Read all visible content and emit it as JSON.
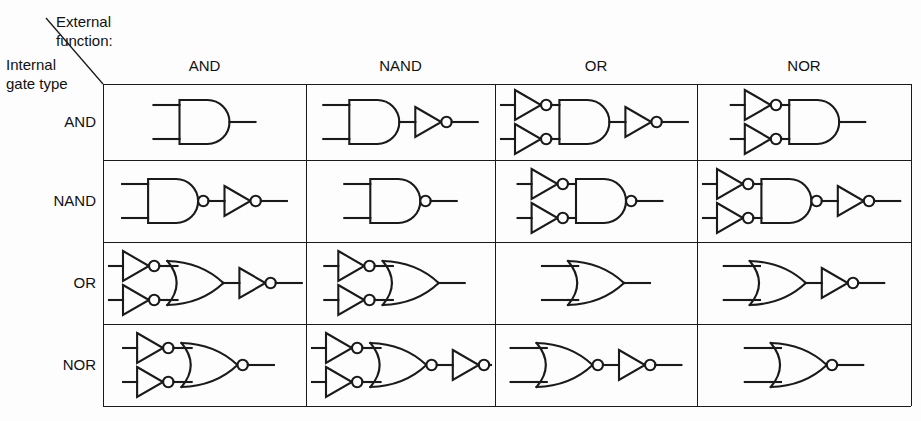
{
  "figure": {
    "type": "logic-gate-equivalence-table",
    "corner": {
      "external_label": "External\nfunction:",
      "internal_label": "Internal\ngate type"
    },
    "columns": [
      "AND",
      "NAND",
      "OR",
      "NOR"
    ],
    "rows": [
      "AND",
      "NAND",
      "OR",
      "NOR"
    ],
    "colors": {
      "ink": "#1a1a1a",
      "paper": "#fdfdfd"
    },
    "cells": [
      {
        "row": "AND",
        "col": "AND",
        "caption": "AND gate",
        "input_inverters": false,
        "gate": "AND",
        "gate_bubble": false,
        "output_inverter": false
      },
      {
        "row": "AND",
        "col": "NAND",
        "caption": "AND gate followed by inverter",
        "input_inverters": false,
        "gate": "AND",
        "gate_bubble": false,
        "output_inverter": true
      },
      {
        "row": "AND",
        "col": "OR",
        "caption": "Two input inverters, AND gate, output inverter",
        "input_inverters": true,
        "gate": "AND",
        "gate_bubble": false,
        "output_inverter": true
      },
      {
        "row": "AND",
        "col": "NOR",
        "caption": "Two input inverters feeding AND gate",
        "input_inverters": true,
        "gate": "AND",
        "gate_bubble": false,
        "output_inverter": false
      },
      {
        "row": "NAND",
        "col": "AND",
        "caption": "NAND gate followed by inverter",
        "input_inverters": false,
        "gate": "AND",
        "gate_bubble": true,
        "output_inverter": true
      },
      {
        "row": "NAND",
        "col": "NAND",
        "caption": "NAND gate",
        "input_inverters": false,
        "gate": "AND",
        "gate_bubble": true,
        "output_inverter": false
      },
      {
        "row": "NAND",
        "col": "OR",
        "caption": "Two input inverters feeding NAND gate",
        "input_inverters": true,
        "gate": "AND",
        "gate_bubble": true,
        "output_inverter": false
      },
      {
        "row": "NAND",
        "col": "NOR",
        "caption": "Two input inverters, NAND gate, output inverter",
        "input_inverters": true,
        "gate": "AND",
        "gate_bubble": true,
        "output_inverter": true
      },
      {
        "row": "OR",
        "col": "AND",
        "caption": "Two input inverters, OR gate, output inverter",
        "input_inverters": true,
        "gate": "OR",
        "gate_bubble": false,
        "output_inverter": true
      },
      {
        "row": "OR",
        "col": "NAND",
        "caption": "Two input inverters feeding OR gate",
        "input_inverters": true,
        "gate": "OR",
        "gate_bubble": false,
        "output_inverter": false
      },
      {
        "row": "OR",
        "col": "OR",
        "caption": "OR gate",
        "input_inverters": false,
        "gate": "OR",
        "gate_bubble": false,
        "output_inverter": false
      },
      {
        "row": "OR",
        "col": "NOR",
        "caption": "OR gate followed by inverter",
        "input_inverters": false,
        "gate": "OR",
        "gate_bubble": false,
        "output_inverter": true
      },
      {
        "row": "NOR",
        "col": "AND",
        "caption": "Two input inverters feeding NOR gate",
        "input_inverters": true,
        "gate": "OR",
        "gate_bubble": true,
        "output_inverter": false
      },
      {
        "row": "NOR",
        "col": "NAND",
        "caption": "Two input inverters, NOR gate, output inverter",
        "input_inverters": true,
        "gate": "OR",
        "gate_bubble": true,
        "output_inverter": true
      },
      {
        "row": "NOR",
        "col": "OR",
        "caption": "NOR gate followed by inverter",
        "input_inverters": false,
        "gate": "OR",
        "gate_bubble": true,
        "output_inverter": true
      },
      {
        "row": "NOR",
        "col": "NOR",
        "caption": "NOR gate",
        "input_inverters": false,
        "gate": "OR",
        "gate_bubble": true,
        "output_inverter": false
      }
    ],
    "geometry": {
      "col_edges": [
        0,
        203,
        392,
        594,
        808
      ],
      "row_edges": [
        0,
        76,
        158,
        240,
        322
      ],
      "grid_left": 103,
      "grid_top": 84
    }
  }
}
